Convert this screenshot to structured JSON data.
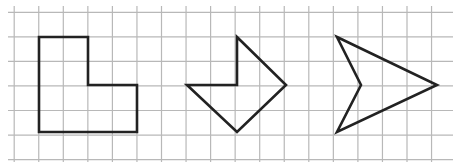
{
  "canvas": {
    "width": 453,
    "height": 162,
    "background": "#ffffff"
  },
  "grid": {
    "color": "#b8b8b8",
    "stroke_width": 1.2,
    "x_start": 14.2,
    "y_start": 12.3,
    "step": 24.55,
    "columns": 18,
    "rows": 7,
    "h_line_x_from": 8,
    "h_line_x_to": 453,
    "v_line_y_from": 6,
    "v_line_y_to": 162
  },
  "shapes": {
    "stroke_color": "#222222",
    "stroke_width": 2.6,
    "items": [
      {
        "name": "l-shape",
        "points": [
          [
            39,
            37
          ],
          [
            88,
            37
          ],
          [
            88,
            85
          ],
          [
            137,
            85
          ],
          [
            137,
            132
          ],
          [
            39,
            132
          ]
        ]
      },
      {
        "name": "arrow-pentagon",
        "points": [
          [
            237,
            37
          ],
          [
            286,
            85
          ],
          [
            237,
            132
          ],
          [
            187,
            85
          ],
          [
            237,
            85
          ]
        ]
      },
      {
        "name": "concave-arrowhead",
        "points": [
          [
            337,
            37
          ],
          [
            437,
            85
          ],
          [
            337,
            132
          ],
          [
            361,
            85
          ]
        ]
      }
    ]
  }
}
